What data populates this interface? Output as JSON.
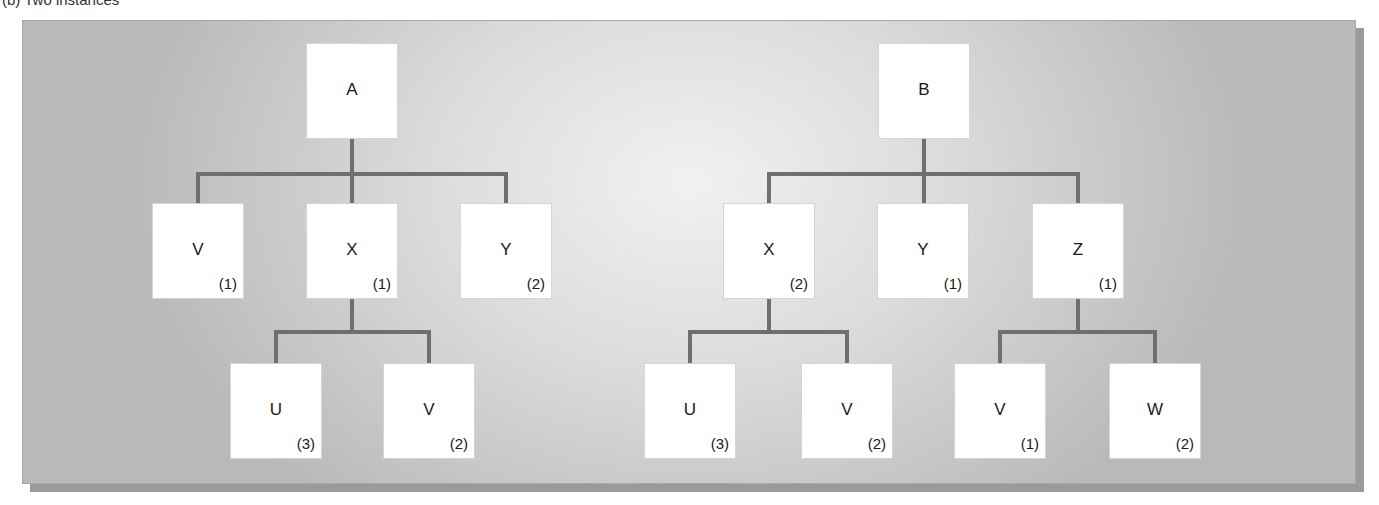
{
  "caption": "(b) Two instances",
  "colors": {
    "connector": "#6f6f6f",
    "node_fill": "#ffffff",
    "panel_center": "#f1f1f1",
    "panel_edge": "#b9b9b9",
    "shadow": "#9a9a9a"
  },
  "trees": [
    {
      "root": {
        "label": "A",
        "count": ""
      },
      "level1": [
        {
          "label": "V",
          "count": "(1)"
        },
        {
          "label": "X",
          "count": "(1)"
        },
        {
          "label": "Y",
          "count": "(2)"
        }
      ],
      "level2_parent": "X",
      "level2": [
        {
          "label": "U",
          "count": "(3)"
        },
        {
          "label": "V",
          "count": "(2)"
        }
      ]
    },
    {
      "root": {
        "label": "B",
        "count": ""
      },
      "level1": [
        {
          "label": "X",
          "count": "(2)"
        },
        {
          "label": "Y",
          "count": "(1)"
        },
        {
          "label": "Z",
          "count": "(1)"
        }
      ],
      "level2_groups": [
        {
          "parent": "X",
          "children": [
            {
              "label": "U",
              "count": "(3)"
            },
            {
              "label": "V",
              "count": "(2)"
            }
          ]
        },
        {
          "parent": "Z",
          "children": [
            {
              "label": "V",
              "count": "(1)"
            },
            {
              "label": "W",
              "count": "(2)"
            }
          ]
        }
      ]
    }
  ]
}
